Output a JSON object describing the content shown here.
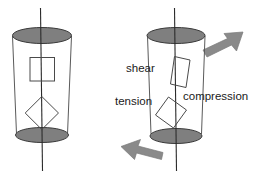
{
  "figure": {
    "title": ""
  },
  "colors": {
    "ellipse_fill": "#7f7f7f",
    "ellipse_stroke": "#3a3a3a",
    "cylinder_stroke": "#5a5a5a",
    "axis_stroke": "#2b2b2b",
    "element_stroke": "#4a4a4a",
    "arrow_fill": "#8a8a8a",
    "arrow_stroke": "#7a7a7a",
    "text": "#1a1a1a",
    "background": "#ffffff"
  },
  "left_cylinder": {
    "name": "plain-cylinder",
    "axis_label": "",
    "elements": [
      {
        "name": "square-element",
        "shape": "square",
        "rotation_deg": 0
      },
      {
        "name": "diamond-element",
        "shape": "square",
        "rotation_deg": 45
      }
    ]
  },
  "right_cylinder": {
    "name": "annotated-cylinder",
    "labels": {
      "shear": "shear",
      "tension": "tension",
      "compression": "compression"
    },
    "elements": [
      {
        "name": "shear-parallelogram",
        "shape": "parallelogram",
        "label_key": "shear"
      },
      {
        "name": "tension-compression-square",
        "shape": "square",
        "rotation_deg": 40,
        "label_keys": [
          "tension",
          "compression"
        ]
      }
    ],
    "arrows": [
      {
        "name": "top-torque-arrow",
        "direction": "up-right"
      },
      {
        "name": "bottom-torque-arrow",
        "direction": "down-left"
      }
    ]
  }
}
